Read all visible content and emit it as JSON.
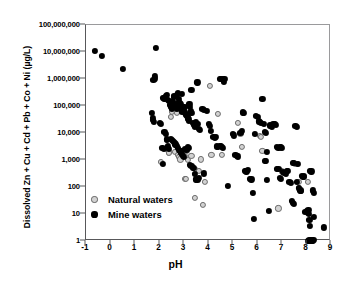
{
  "chart_data": {
    "type": "scatter",
    "title": "",
    "xlabel": "pH",
    "ylabel": "Dissolved Zn + Cu + Cd + Pb + Co + Ni (µg/L)",
    "xlim": [
      -1,
      9
    ],
    "ylim": [
      1,
      100000000
    ],
    "yscale": "log",
    "xscale": "linear",
    "grid": false,
    "legend_position": "lower-left-inside",
    "xticks": [
      -1,
      0,
      1,
      2,
      3,
      4,
      5,
      6,
      7,
      8,
      9
    ],
    "xtick_labels": [
      "-1",
      "0",
      "1",
      "2",
      "3",
      "4",
      "5",
      "6",
      "7",
      "8",
      "9"
    ],
    "yticks": [
      1,
      10,
      100,
      1000,
      10000,
      100000,
      1000000,
      10000000,
      100000000
    ],
    "ytick_labels": [
      "1",
      "10",
      "100",
      "1,000",
      "10,000",
      "100,000",
      "1,000,000",
      "10,000,000",
      "100,000,000"
    ],
    "series": [
      {
        "name": "Natural waters",
        "marker": "open-circle",
        "color": "#d2d2d2",
        "edge_color": "#6b6b6b",
        "points": [
          [
            2.05,
            850
          ],
          [
            2.3,
            5500
          ],
          [
            2.35,
            2400
          ],
          [
            2.38,
            1800
          ],
          [
            2.4,
            1900
          ],
          [
            2.45,
            40000
          ],
          [
            2.5,
            60000
          ],
          [
            2.62,
            2000
          ],
          [
            2.75,
            1500
          ],
          [
            2.8,
            1300
          ],
          [
            2.85,
            1050
          ],
          [
            2.88,
            1900
          ],
          [
            2.92,
            2100
          ],
          [
            2.95,
            1750
          ],
          [
            3.0,
            2000
          ],
          [
            3.02,
            1400
          ],
          [
            3.05,
            200
          ],
          [
            3.08,
            195
          ],
          [
            3.12,
            2200
          ],
          [
            3.15,
            1000
          ],
          [
            2.7,
            55000
          ],
          [
            2.78,
            95000
          ],
          [
            3.3,
            1400
          ],
          [
            3.45,
            40
          ],
          [
            3.5,
            420
          ],
          [
            3.62,
            390
          ],
          [
            3.7,
            1050
          ],
          [
            3.78,
            22
          ],
          [
            3.85,
            150
          ],
          [
            4.05,
            560000
          ],
          [
            4.12,
            1500
          ],
          [
            4.4,
            52000
          ],
          [
            4.55,
            1500
          ],
          [
            5.2,
            24000
          ],
          [
            5.3,
            9500
          ],
          [
            5.35,
            3000
          ],
          [
            6.1,
            7800
          ],
          [
            6.15,
            7400
          ],
          [
            6.2,
            2100
          ],
          [
            6.85,
            16
          ],
          [
            7.0,
            380
          ],
          [
            7.55,
            700
          ],
          [
            7.6,
            720
          ],
          [
            7.68,
            150
          ],
          [
            7.7,
            88
          ],
          [
            8.05,
            150
          ],
          [
            6.95,
            2800
          ]
        ]
      },
      {
        "name": "Mine waters",
        "marker": "filled-circle",
        "color": "#000000",
        "points": [
          [
            -0.65,
            11000000
          ],
          [
            -0.35,
            7000000
          ],
          [
            0.5,
            2300000
          ],
          [
            1.85,
            14000000
          ],
          [
            1.8,
            1250000
          ],
          [
            1.82,
            1000000
          ],
          [
            1.75,
            900000
          ],
          [
            1.7,
            55000
          ],
          [
            1.72,
            35000
          ],
          [
            1.74,
            30000
          ],
          [
            1.78,
            26000
          ],
          [
            2.0,
            24000
          ],
          [
            2.05,
            22000
          ],
          [
            2.15,
            200000
          ],
          [
            2.2,
            190000
          ],
          [
            2.25,
            230000
          ],
          [
            2.3,
            260000
          ],
          [
            2.35,
            170000
          ],
          [
            2.4,
            150000
          ],
          [
            2.42,
            110000
          ],
          [
            2.45,
            95000
          ],
          [
            2.48,
            100000
          ],
          [
            2.5,
            88000
          ],
          [
            2.52,
            80000
          ],
          [
            2.55,
            150000
          ],
          [
            2.58,
            210000
          ],
          [
            2.6,
            240000
          ],
          [
            2.62,
            120000
          ],
          [
            2.65,
            105000
          ],
          [
            2.68,
            92000
          ],
          [
            2.7,
            78000
          ],
          [
            2.72,
            250000
          ],
          [
            2.75,
            300000
          ],
          [
            2.78,
            180000
          ],
          [
            2.8,
            135000
          ],
          [
            2.82,
            125000
          ],
          [
            2.85,
            115000
          ],
          [
            2.88,
            97000
          ],
          [
            2.9,
            70000
          ],
          [
            2.92,
            60000
          ],
          [
            2.95,
            72000
          ],
          [
            2.98,
            66000
          ],
          [
            3.0,
            83000
          ],
          [
            3.02,
            90000
          ],
          [
            3.05,
            58000
          ],
          [
            3.08,
            52000
          ],
          [
            3.1,
            46000
          ],
          [
            3.12,
            42000
          ],
          [
            3.15,
            38000
          ],
          [
            3.18,
            33000
          ],
          [
            3.2,
            29000
          ],
          [
            3.22,
            120000
          ],
          [
            3.25,
            95000
          ],
          [
            3.28,
            64000
          ],
          [
            3.3,
            56000
          ],
          [
            3.35,
            24000
          ],
          [
            3.4,
            20000
          ],
          [
            3.45,
            17000
          ],
          [
            3.5,
            25000
          ],
          [
            3.55,
            22000
          ],
          [
            3.6,
            14000
          ],
          [
            3.65,
            13000
          ],
          [
            2.2,
            11000
          ],
          [
            2.25,
            9500
          ],
          [
            2.3,
            5800
          ],
          [
            2.35,
            3200
          ],
          [
            2.4,
            2600
          ],
          [
            2.45,
            6200
          ],
          [
            2.5,
            5400
          ],
          [
            2.55,
            5000
          ],
          [
            2.58,
            4600
          ],
          [
            2.62,
            4200
          ],
          [
            2.65,
            3800
          ],
          [
            2.7,
            3400
          ],
          [
            2.75,
            2900
          ],
          [
            2.8,
            2400
          ],
          [
            2.85,
            2200
          ],
          [
            2.88,
            1900
          ],
          [
            2.9,
            1700
          ],
          [
            2.95,
            1450
          ],
          [
            3.0,
            1300
          ],
          [
            3.05,
            2600
          ],
          [
            3.1,
            2300
          ],
          [
            3.15,
            3000
          ],
          [
            3.2,
            2800
          ],
          [
            3.25,
            650
          ],
          [
            3.3,
            620
          ],
          [
            3.35,
            520
          ],
          [
            3.4,
            500
          ],
          [
            3.45,
            300
          ],
          [
            3.5,
            190
          ],
          [
            3.55,
            180
          ],
          [
            3.6,
            210
          ],
          [
            3.8,
            320
          ],
          [
            2.15,
            700
          ],
          [
            2.12,
            2800
          ],
          [
            2.18,
            2500
          ],
          [
            3.75,
            78000
          ],
          [
            3.8,
            72000
          ],
          [
            3.95,
            65000
          ],
          [
            4.0,
            22000
          ],
          [
            4.05,
            18000
          ],
          [
            4.1,
            12000
          ],
          [
            4.2,
            7000
          ],
          [
            4.25,
            6500
          ],
          [
            4.3,
            7400
          ],
          [
            4.35,
            3200
          ],
          [
            4.4,
            3000
          ],
          [
            4.45,
            3400
          ],
          [
            4.5,
            3300
          ],
          [
            4.55,
            3100
          ],
          [
            4.6,
            2900
          ],
          [
            4.62,
            760000
          ],
          [
            4.45,
            980000
          ],
          [
            4.5,
            1000000
          ],
          [
            4.6,
            1020000
          ],
          [
            4.65,
            980000
          ],
          [
            4.8,
            110
          ],
          [
            3.55,
            750000
          ],
          [
            3.3,
            400000
          ],
          [
            5.0,
            9000
          ],
          [
            5.05,
            8200
          ],
          [
            5.1,
            1500
          ],
          [
            5.15,
            1400
          ],
          [
            5.2,
            1350
          ],
          [
            5.3,
            9800
          ],
          [
            5.35,
            12000
          ],
          [
            5.4,
            58000
          ],
          [
            5.45,
            55000
          ],
          [
            5.5,
            400
          ],
          [
            5.55,
            380
          ],
          [
            5.6,
            420
          ],
          [
            5.7,
            200
          ],
          [
            5.75,
            190
          ],
          [
            5.8,
            60
          ],
          [
            5.85,
            6.5
          ],
          [
            5.9,
            9500
          ],
          [
            5.95,
            42000
          ],
          [
            6.0,
            40000
          ],
          [
            6.05,
            27000
          ],
          [
            6.1,
            25000
          ],
          [
            6.15,
            23000
          ],
          [
            6.2,
            180000
          ],
          [
            6.25,
            22000
          ],
          [
            6.3,
            11000
          ],
          [
            6.35,
            10000
          ],
          [
            6.4,
            180
          ],
          [
            6.45,
            13
          ],
          [
            6.5,
            19000
          ],
          [
            6.55,
            18000
          ],
          [
            6.6,
            17500
          ],
          [
            6.65,
            22000
          ],
          [
            6.7,
            21000
          ],
          [
            6.75,
            20000
          ],
          [
            6.8,
            3000
          ],
          [
            6.85,
            2900
          ],
          [
            6.9,
            3100
          ],
          [
            6.95,
            3000
          ],
          [
            7.0,
            2800
          ],
          [
            7.05,
            360
          ],
          [
            7.1,
            340
          ],
          [
            7.15,
            320
          ],
          [
            7.2,
            390
          ],
          [
            7.25,
            400
          ],
          [
            7.3,
            150
          ],
          [
            7.35,
            140
          ],
          [
            7.4,
            30
          ],
          [
            7.45,
            26
          ],
          [
            7.5,
            24
          ],
          [
            7.55,
            18000
          ],
          [
            7.6,
            17000
          ],
          [
            7.65,
            700
          ],
          [
            7.7,
            92
          ],
          [
            7.75,
            75
          ],
          [
            7.78,
            70
          ],
          [
            7.8,
            250
          ],
          [
            7.85,
            230
          ],
          [
            7.88,
            260
          ],
          [
            7.9,
            240
          ],
          [
            7.95,
            12
          ],
          [
            8.0,
            13
          ],
          [
            8.05,
            11
          ],
          [
            8.08,
            14
          ],
          [
            8.1,
            10
          ],
          [
            8.12,
            6
          ],
          [
            8.15,
            3.5
          ],
          [
            8.18,
            1.05
          ],
          [
            8.2,
            1.1
          ],
          [
            8.22,
            1.0
          ],
          [
            8.25,
            1.0
          ],
          [
            8.28,
            1.1
          ],
          [
            8.1,
            1.05
          ],
          [
            8.15,
            1.0
          ],
          [
            8.05,
            1.0
          ],
          [
            8.7,
            3.2
          ],
          [
            8.3,
            60
          ],
          [
            8.25,
            75
          ],
          [
            8.2,
            380
          ],
          [
            8.15,
            400
          ],
          [
            8.3,
            8
          ],
          [
            6.3,
            950
          ],
          [
            6.35,
            900
          ],
          [
            6.4,
            2000
          ],
          [
            6.8,
            480
          ],
          [
            6.85,
            460
          ],
          [
            7.45,
            800
          ],
          [
            7.5,
            760
          ],
          [
            6.9,
            220
          ],
          [
            6.95,
            200
          ],
          [
            7.6,
            150
          ],
          [
            2.9,
            280000
          ]
        ]
      }
    ]
  },
  "legend": {
    "items": [
      {
        "label": "Natural waters",
        "marker": "open-circle"
      },
      {
        "label": "Mine waters",
        "marker": "filled-circle"
      }
    ]
  }
}
